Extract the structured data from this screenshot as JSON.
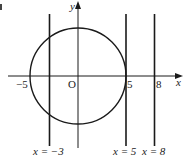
{
  "figure": {
    "corner_fragment": "b",
    "axes": {
      "x_label": "x",
      "y_label": "y",
      "origin_label": "O"
    },
    "tick_labels": {
      "neg5": "−5",
      "pos5": "5",
      "pos8": "8"
    },
    "circle": {
      "center": [
        0,
        0
      ],
      "radius": 5
    },
    "vertical_lines": [
      {
        "x": -3,
        "label": "x = −3"
      },
      {
        "x": 5,
        "label": "x = 5"
      },
      {
        "x": 8,
        "label": "x = 8"
      }
    ],
    "colors": {
      "stroke": "#1a1a1a",
      "text": "#222222"
    }
  }
}
